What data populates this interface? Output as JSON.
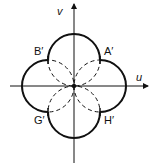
{
  "diagram": {
    "axes": {
      "horizontal_label": "u",
      "vertical_label": "v"
    },
    "labels": {
      "a": "A′",
      "b": "B′",
      "g": "G′",
      "h": "H′"
    },
    "colors": {
      "stroke": "#111111",
      "background": "#ffffff"
    }
  }
}
